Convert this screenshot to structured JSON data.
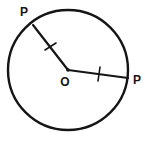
{
  "figure": {
    "name": "circle-with-two-congruent-radii",
    "background_color": "#ffffff",
    "stroke_color": "#151515",
    "label_color": "#151515",
    "canvas": {
      "width": 145,
      "height": 143
    }
  },
  "circle": {
    "name": "main-circle",
    "center_x": 68,
    "center_y": 70,
    "radius": 60,
    "stroke_width": 2.4
  },
  "center_point": {
    "label": "O",
    "x": 68,
    "y": 70,
    "label_x": 65,
    "label_y": 83,
    "dot_radius": 1.8
  },
  "radii": [
    {
      "id": "radius-upper-left",
      "label": "P",
      "from_x": 68,
      "from_y": 70,
      "to_x": 33,
      "to_y": 25,
      "label_x": 24,
      "label_y": 13,
      "stroke_width": 2.2,
      "tick": {
        "id": "tick-upper-left",
        "x1": 45,
        "y1": 50,
        "x2": 56,
        "y2": 43,
        "stroke_width": 1.6
      }
    },
    {
      "id": "radius-right",
      "label": "P",
      "from_x": 68,
      "from_y": 70,
      "to_x": 128,
      "to_y": 78,
      "label_x": 137,
      "label_y": 81,
      "stroke_width": 2.2,
      "tick": {
        "id": "tick-right",
        "x1": 100,
        "y1": 67,
        "x2": 98,
        "y2": 81,
        "stroke_width": 1.6
      }
    }
  ],
  "labels": {
    "center": "O",
    "point_upper_left": "P",
    "point_right": "P"
  }
}
